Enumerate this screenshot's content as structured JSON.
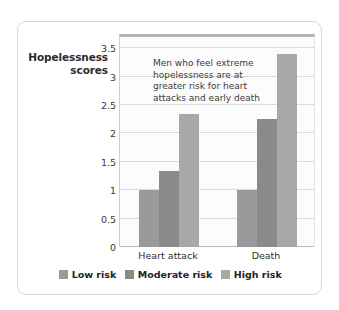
{
  "chart_data": {
    "type": "bar",
    "title": "",
    "xlabel": "",
    "ylabel": "Hopelessness scores",
    "categories": [
      "Heart attack",
      "Death"
    ],
    "series": [
      {
        "name": "Low risk",
        "color": "#9a9a9a",
        "values": [
          1.0,
          1.0
        ]
      },
      {
        "name": "Moderate risk",
        "color": "#8a8a8a",
        "values": [
          1.33,
          2.26
        ]
      },
      {
        "name": "High risk",
        "color": "#a8a8a8",
        "values": [
          2.35,
          3.4
        ]
      }
    ],
    "ylim": [
      0,
      3.75
    ],
    "yticks": [
      "0",
      "0.5",
      "1",
      "1.5",
      "2",
      "2.5",
      "3",
      "3.5"
    ],
    "ytick_values": [
      0,
      0.5,
      1,
      1.5,
      2,
      2.5,
      3,
      3.5
    ],
    "grid": true,
    "legend_position": "bottom",
    "annotation": "Men who feel extreme hopelessness are at greater risk for heart attacks and early death"
  },
  "axis": {
    "title_line1": "Hopelessness",
    "title_line2": "scores"
  },
  "annotation": {
    "line1": "Men who feel extreme",
    "line2": "hopelessness are at",
    "line3": "greater risk for heart",
    "line4": "attacks and early death"
  },
  "colors": {
    "card_border": "#d6d6d6",
    "plot_background": "#fcfcfc",
    "gridline": "#dadada",
    "baseline": "#b9b9b9",
    "plot_top_rule": "#b4b4b4",
    "text": "#2b2b2b"
  }
}
